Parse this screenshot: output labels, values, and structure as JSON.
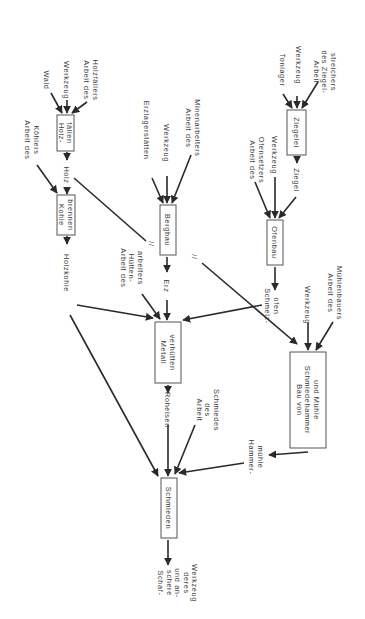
{
  "colors": {
    "line": "#2a2a2a",
    "text": "#3a3a3a",
    "box": "#555555"
  },
  "nodes": {
    "holzfaellen": [
      "Holz-",
      "fällen"
    ],
    "kohle": [
      "Kohle",
      "brennen"
    ],
    "bergbau": [
      "Bergbau"
    ],
    "ziegelei": [
      "Ziegelei"
    ],
    "ofenbau": [
      "Ofenbau"
    ],
    "metall": [
      "Metall",
      "verhütten"
    ],
    "bau": [
      "Bau von",
      "Schmiedehammer",
      "und Mühle"
    ],
    "schmieden": [
      "Schmieden"
    ]
  },
  "labels": {
    "wald": [
      "Wald"
    ],
    "werkzeug1": [
      "Werkzeug"
    ],
    "holzfaeller": [
      "Arbeit des",
      "Holzfällers"
    ],
    "koehler": [
      "Arbeit des",
      "Köhlers"
    ],
    "holz": [
      "Holz"
    ],
    "holzkohle": [
      "Holzkohle"
    ],
    "erzlager": [
      "Erzlagerstätten"
    ],
    "werkzeug2": [
      "Werkzeug"
    ],
    "minen": [
      "Arbeit des",
      "Minenarbeiters"
    ],
    "huetten": [
      "Arbeit des",
      "Hütten-",
      "arbeiters"
    ],
    "erz": [
      "Erz"
    ],
    "tonlager": [
      "Tonlager"
    ],
    "werkzeug3": [
      "Werkzeug"
    ],
    "ziegelstr": [
      "Arbeit",
      "des Ziegel-",
      "streichers"
    ],
    "ofensetzer": [
      "Arbeit des",
      "Ofensetzers"
    ],
    "werkzeug4": [
      "Werkzeug"
    ],
    "ziegel": [
      "Ziegel"
    ],
    "schmelzofen": [
      "Schmelz-",
      "ofen"
    ],
    "werkzeug5": [
      "Werkzeug"
    ],
    "muehlenbauer": [
      "Arbeit des",
      "Mühlenbauers"
    ],
    "roheisen": [
      "Roheisen"
    ],
    "schmied": [
      "Arbeit",
      "des",
      "Schmiedes"
    ],
    "hammer": [
      "Hammer-",
      "mühle"
    ],
    "output": [
      "Schaf-",
      "schere",
      "und an-",
      "deres",
      "Werkzeug"
    ]
  },
  "marks": {
    "flow_break": "//"
  }
}
